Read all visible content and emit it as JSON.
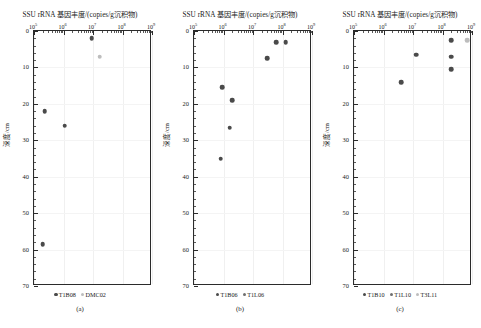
{
  "figure": {
    "axis_title": "SSU rRNA 基因丰度/(copies/g沉积物)",
    "ylabel": "深度/cm",
    "xtick_labels": [
      "10",
      "10",
      "10",
      "10",
      "10"
    ],
    "xtick_exponents": [
      "5",
      "6",
      "7",
      "8",
      "9"
    ],
    "ytick_labels": [
      "0",
      "10",
      "20",
      "30",
      "40",
      "50",
      "60",
      "70"
    ],
    "colors": {
      "dark": "#4a4a4a",
      "mid": "#6f6f6f",
      "light": "#bdbdbd",
      "axis": "#2b2b2b",
      "grid": "#f0f0f0"
    }
  },
  "chart_data": [
    {
      "type": "scatter",
      "panel": "a",
      "caption": "(a)",
      "title": "SSU rRNA 基因丰度/(copies/g沉积物)",
      "xlabel": "SSU rRNA 基因丰度/(copies/g沉积物)",
      "ylabel": "深度/cm",
      "xscale": "log",
      "xlim": [
        100000,
        1000000000
      ],
      "ylim": [
        0,
        70
      ],
      "y_inverted": true,
      "grid": true,
      "legend_position": "below",
      "series": [
        {
          "name": "T1B08",
          "color": "#4a4a4a",
          "points": [
            {
              "x": 9000000,
              "y": 2.0
            },
            {
              "x": 230000,
              "y": 22.0
            },
            {
              "x": 1100000,
              "y": 26.0
            },
            {
              "x": 200000,
              "y": 58.5
            }
          ]
        },
        {
          "name": "DMC02",
          "color": "#bdbdbd",
          "points": [
            {
              "x": 17000000,
              "y": 7.0
            }
          ]
        }
      ]
    },
    {
      "type": "scatter",
      "panel": "b",
      "caption": "(b)",
      "title": "SSU rRNA 基因丰度/(copies/g沉积物)",
      "xlabel": "SSU rRNA 基因丰度/(copies/g沉积物)",
      "ylabel": "深度/cm",
      "xscale": "log",
      "xlim": [
        100000,
        1000000000
      ],
      "ylim": [
        0,
        70
      ],
      "y_inverted": true,
      "grid": true,
      "legend_position": "below",
      "series": [
        {
          "name": "T1B06",
          "color": "#4a4a4a",
          "points": [
            {
              "x": 60000000,
              "y": 3.0
            },
            {
              "x": 130000000,
              "y": 3.0
            },
            {
              "x": 30000000,
              "y": 7.5
            },
            {
              "x": 900000,
              "y": 15.5
            },
            {
              "x": 2000000,
              "y": 19.0
            },
            {
              "x": 1600000,
              "y": 26.5
            },
            {
              "x": 800000,
              "y": 35.0
            }
          ]
        },
        {
          "name": "T1L06",
          "color": "#6f6f6f",
          "points": []
        }
      ]
    },
    {
      "type": "scatter",
      "panel": "c",
      "caption": "(c)",
      "title": "SSU rRNA 基因丰度/(copies/g沉积物)",
      "xlabel": "SSU rRNA 基因丰度/(copies/g沉积物)",
      "ylabel": "深度/cm",
      "xscale": "log",
      "xlim": [
        100000,
        1000000000
      ],
      "ylim": [
        0,
        70
      ],
      "y_inverted": true,
      "grid": true,
      "legend_position": "below",
      "series": [
        {
          "name": "T1B10",
          "color": "#4a4a4a",
          "points": [
            {
              "x": 200000000,
              "y": 2.5
            },
            {
              "x": 200000000,
              "y": 7.0
            },
            {
              "x": 200000000,
              "y": 10.5
            },
            {
              "x": 13000000,
              "y": 6.5
            },
            {
              "x": 4000000,
              "y": 14.0
            }
          ]
        },
        {
          "name": "T1L10",
          "color": "#6f6f6f",
          "points": []
        },
        {
          "name": "T3L11",
          "color": "#bdbdbd",
          "points": [
            {
              "x": 700000000,
              "y": 2.5
            }
          ]
        }
      ]
    }
  ],
  "legends": {
    "a": [
      {
        "label": "T1B08",
        "color": "#4a4a4a"
      },
      {
        "label": "DMC02",
        "color": "#bdbdbd"
      }
    ],
    "b": [
      {
        "label": "T1B06",
        "color": "#4a4a4a"
      },
      {
        "label": "T1L06",
        "color": "#6f6f6f"
      }
    ],
    "c": [
      {
        "label": "T1B10",
        "color": "#4a4a4a"
      },
      {
        "label": "T1L10",
        "color": "#6f6f6f"
      },
      {
        "label": "T3L11",
        "color": "#bdbdbd"
      }
    ]
  },
  "captions": {
    "a": "(a)",
    "b": "(b)",
    "c": "(c)"
  }
}
